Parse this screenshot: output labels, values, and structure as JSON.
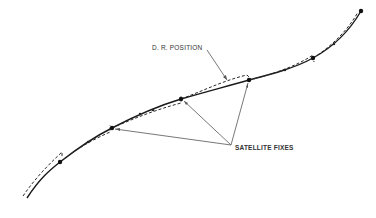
{
  "diagram": {
    "labels": {
      "dr_position": "D. R. POSITION",
      "satellite_fixes": "SATELLITE FIXES"
    },
    "colors": {
      "track": "#1a1a1a",
      "dashed": "#2a2a2a",
      "leader": "#555555",
      "text": "#333333"
    },
    "satellite_fixes": [
      {
        "x": 60,
        "y": 162
      },
      {
        "x": 112,
        "y": 128
      },
      {
        "x": 181,
        "y": 99
      },
      {
        "x": 249,
        "y": 80
      },
      {
        "x": 313,
        "y": 58
      },
      {
        "x": 361,
        "y": 11
      }
    ],
    "arrow_target": {
      "x": 231,
      "y": 145
    }
  }
}
